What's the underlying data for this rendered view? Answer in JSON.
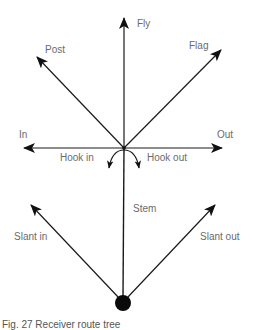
{
  "diagram": {
    "title": "Receiver route tree",
    "labels": {
      "fly": "Fly",
      "post": "Post",
      "flag": "Flag",
      "in": "In",
      "out": "Out",
      "hook_in": "Hook in",
      "hook_out": "Hook out",
      "stem": "Stem",
      "slant_in": "Slant in",
      "slant_out": "Slant out"
    },
    "caption": "Fig. 27   Receiver route tree",
    "colors": {
      "line": "#1a1a1a",
      "label": "#6b6b6b",
      "background": "#ffffff"
    },
    "nodes": [
      {
        "id": "ball",
        "x": 123,
        "y": 303,
        "r": 8
      },
      {
        "id": "break-point",
        "x": 124,
        "y": 148
      }
    ],
    "routes": [
      {
        "name": "Fly",
        "from": [
          124,
          148
        ],
        "to": [
          124,
          18
        ]
      },
      {
        "name": "Post",
        "from": [
          124,
          148
        ],
        "to": [
          37,
          57
        ]
      },
      {
        "name": "Flag",
        "from": [
          124,
          148
        ],
        "to": [
          221,
          50
        ]
      },
      {
        "name": "In",
        "from": [
          124,
          148
        ],
        "to": [
          24,
          148
        ]
      },
      {
        "name": "Out",
        "from": [
          124,
          148
        ],
        "to": [
          222,
          148
        ]
      },
      {
        "name": "Hook in",
        "from": [
          124,
          148
        ],
        "to": [
          110,
          168
        ],
        "curved": true
      },
      {
        "name": "Hook out",
        "from": [
          124,
          148
        ],
        "to": [
          138,
          168
        ],
        "curved": true
      },
      {
        "name": "Stem",
        "from": [
          123,
          303
        ],
        "to": [
          124,
          148
        ]
      },
      {
        "name": "Slant in",
        "from": [
          123,
          303
        ],
        "to": [
          31,
          205
        ]
      },
      {
        "name": "Slant out",
        "from": [
          123,
          303
        ],
        "to": [
          215,
          205
        ]
      }
    ]
  }
}
